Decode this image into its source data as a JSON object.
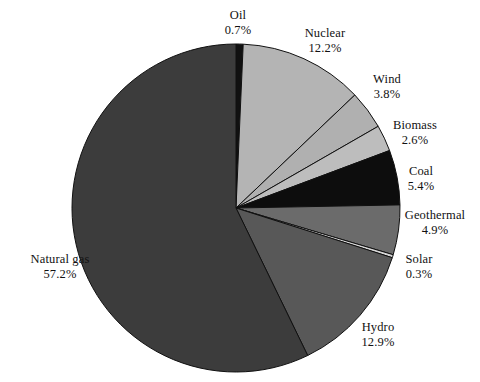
{
  "chart_data": {
    "type": "pie",
    "title": "",
    "subtitle": "",
    "xlabel": "",
    "ylabel": "",
    "legend_position": "none",
    "grid": false,
    "units": "percent",
    "start_angle_deg": 0,
    "direction": "clockwise",
    "categories": [
      "Oil",
      "Nuclear",
      "Wind",
      "Biomass",
      "Coal",
      "Geothermal",
      "Solar",
      "Hydro",
      "Natural gas"
    ],
    "values": [
      0.7,
      12.2,
      3.8,
      2.6,
      5.4,
      4.9,
      0.3,
      12.9,
      57.2
    ],
    "value_labels": [
      "0.7%",
      "12.2%",
      "3.8%",
      "2.6%",
      "5.4%",
      "4.9%",
      "0.3%",
      "12.9%",
      "57.2%"
    ],
    "colors": [
      "#111111",
      "#b4b4b4",
      "#b0b0b0",
      "#bdbdbd",
      "#0d0d0d",
      "#6b6b6b",
      "#d6d6d6",
      "#585858",
      "#3c3c3c"
    ],
    "slices": [
      {
        "name": "Oil",
        "value": 0.7,
        "label": "Oil",
        "value_label": "0.7%",
        "color": "#111111"
      },
      {
        "name": "Nuclear",
        "value": 12.2,
        "label": "Nuclear",
        "value_label": "12.2%",
        "color": "#b4b4b4"
      },
      {
        "name": "Wind",
        "value": 3.8,
        "label": "Wind",
        "value_label": "3.8%",
        "color": "#b0b0b0"
      },
      {
        "name": "Biomass",
        "value": 2.6,
        "label": "Biomass",
        "value_label": "2.6%",
        "color": "#bdbdbd"
      },
      {
        "name": "Coal",
        "value": 5.4,
        "label": "Coal",
        "value_label": "5.4%",
        "color": "#0d0d0d"
      },
      {
        "name": "Geothermal",
        "value": 4.9,
        "label": "Geothermal",
        "value_label": "4.9%",
        "color": "#6b6b6b"
      },
      {
        "name": "Solar",
        "value": 0.3,
        "label": "Solar",
        "value_label": "0.3%",
        "color": "#d6d6d6"
      },
      {
        "name": "Hydro",
        "value": 12.9,
        "label": "Hydro",
        "value_label": "12.9%",
        "color": "#585858"
      },
      {
        "name": "Natural gas",
        "value": 57.2,
        "label": "Natural gas",
        "value_label": "57.2%",
        "color": "#3c3c3c"
      }
    ]
  },
  "geometry": {
    "center_x": 236,
    "center_y": 208,
    "radius": 164
  },
  "labels": {
    "oil": {
      "name": "Oil",
      "value": "0.7%",
      "x": 203,
      "y": 8,
      "align": "center",
      "width": 70
    },
    "nuclear": {
      "name": "Nuclear",
      "value": "12.2%",
      "x": 288,
      "y": 26,
      "align": "center",
      "width": 74
    },
    "wind": {
      "name": "Wind",
      "value": "3.8%",
      "x": 358,
      "y": 72,
      "align": "center",
      "width": 58
    },
    "biomass": {
      "name": "Biomass",
      "value": "2.6%",
      "x": 378,
      "y": 118,
      "align": "center",
      "width": 74
    },
    "coal": {
      "name": "Coal",
      "value": "5.4%",
      "x": 392,
      "y": 164,
      "align": "center",
      "width": 58
    },
    "geothermal": {
      "name": "Geothermal",
      "value": "4.9%",
      "x": 392,
      "y": 208,
      "align": "center",
      "width": 86
    },
    "solar": {
      "name": "Solar",
      "value": "0.3%",
      "x": 390,
      "y": 252,
      "align": "center",
      "width": 58
    },
    "hydro": {
      "name": "Hydro",
      "value": "12.9%",
      "x": 348,
      "y": 320,
      "align": "center",
      "width": 60
    },
    "natural_gas": {
      "name": "Natural gas",
      "value": "57.2%",
      "x": 10,
      "y": 252,
      "align": "center",
      "width": 100
    }
  }
}
